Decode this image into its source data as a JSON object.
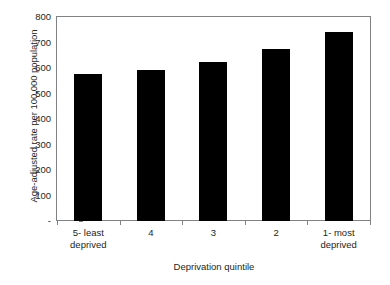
{
  "chart_data": {
    "type": "bar",
    "title": "",
    "categories": [
      "5- least deprived",
      "4",
      "3",
      "2",
      "1- most deprived"
    ],
    "values": [
      578,
      592,
      623,
      675,
      742
    ],
    "xlabel": "Deprivation quintile",
    "ylabel": "Age-adjusted rate per 100,000 population",
    "ylim": [
      0,
      800
    ],
    "yticks": [
      0,
      100,
      200,
      300,
      400,
      500,
      600,
      700,
      800
    ],
    "ytick_labels": [
      "-",
      "100",
      "200",
      "300",
      "400",
      "500",
      "600",
      "700",
      "800"
    ],
    "grid": false,
    "legend": null,
    "bar_color": "#000000",
    "axis_color": "#808285",
    "text_color": "#231f20",
    "background": "#ffffff"
  }
}
